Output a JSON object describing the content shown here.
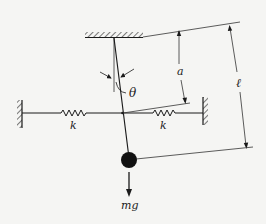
{
  "diagram": {
    "type": "pendulum-with-springs",
    "labels": {
      "angle": "θ",
      "spring_left": "k",
      "spring_right": "k",
      "dim_a": "a",
      "dim_l": "ℓ",
      "weight": "mg"
    },
    "colors": {
      "ink": "#1a1a1a",
      "background": "#f5f5f3"
    }
  }
}
